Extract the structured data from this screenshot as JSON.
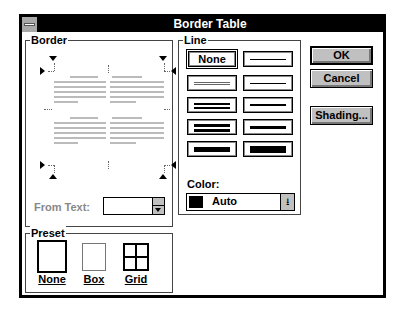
{
  "window": {
    "title": "Border Table"
  },
  "border_group": {
    "label": "Border",
    "label_underline": "r",
    "from_text_label": "From Text:",
    "from_text_value": ""
  },
  "preset_group": {
    "label": "Preset",
    "options": [
      {
        "label": "None",
        "mnemonic": "N"
      },
      {
        "label": "Box",
        "mnemonic": "B"
      },
      {
        "label": "Grid",
        "mnemonic": "G"
      }
    ]
  },
  "line_group": {
    "label": "Line",
    "none_label": "None",
    "styles": [
      "none",
      "hairline",
      "double-thin",
      "single-1",
      "double-1",
      "single-2",
      "double-2",
      "single-3",
      "thick-1",
      "thick-2"
    ],
    "color_label": "Color:",
    "color_value": "Auto",
    "color_swatch": "#000000"
  },
  "buttons": {
    "ok": "OK",
    "cancel": "Cancel",
    "shading": "Shading..."
  }
}
